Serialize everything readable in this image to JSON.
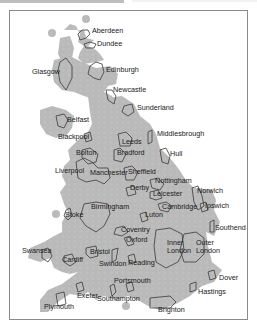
{
  "map": {
    "type": "hexagonal cartogram",
    "region": "United Kingdom",
    "colors": {
      "land_fill": "#bdbdbd",
      "hex_stroke": "#a8a8a8",
      "city_outline": "#3a3a3a",
      "frame": "#8a8a8a",
      "background": "#ffffff",
      "label": "#1a1a1a"
    },
    "labels": [
      {
        "name": "Aberdeen",
        "x": 92,
        "y": 33
      },
      {
        "name": "Dundee",
        "x": 97,
        "y": 46
      },
      {
        "name": "Glasgow",
        "x": 32,
        "y": 74
      },
      {
        "name": "Edinburgh",
        "x": 106,
        "y": 72
      },
      {
        "name": "Newcastle",
        "x": 113,
        "y": 92
      },
      {
        "name": "Sunderland",
        "x": 137,
        "y": 110
      },
      {
        "name": "Belfast",
        "x": 67,
        "y": 122
      },
      {
        "name": "Blackpool",
        "x": 58,
        "y": 139
      },
      {
        "name": "Middlesbrough",
        "x": 157,
        "y": 136
      },
      {
        "name": "Bolton",
        "x": 76,
        "y": 155
      },
      {
        "name": "Leeds",
        "x": 122,
        "y": 144
      },
      {
        "name": "Bradford",
        "x": 117,
        "y": 155
      },
      {
        "name": "Hull",
        "x": 170,
        "y": 156
      },
      {
        "name": "Liverpool",
        "x": 55,
        "y": 173
      },
      {
        "name": "Manchester",
        "x": 90,
        "y": 175
      },
      {
        "name": "Sheffield",
        "x": 128,
        "y": 174
      },
      {
        "name": "Nottingham",
        "x": 155,
        "y": 183
      },
      {
        "name": "Derby",
        "x": 130,
        "y": 190
      },
      {
        "name": "Norwich",
        "x": 197,
        "y": 193
      },
      {
        "name": "Leicester",
        "x": 153,
        "y": 196
      },
      {
        "name": "Ipswich",
        "x": 205,
        "y": 208
      },
      {
        "name": "Cambridge",
        "x": 162,
        "y": 209
      },
      {
        "name": "Birmingham",
        "x": 91,
        "y": 209
      },
      {
        "name": "Stoke",
        "x": 65,
        "y": 217
      },
      {
        "name": "Luton",
        "x": 145,
        "y": 217
      },
      {
        "name": "Southend",
        "x": 215,
        "y": 230
      },
      {
        "name": "Coventry",
        "x": 121,
        "y": 232
      },
      {
        "name": "Oxford",
        "x": 126,
        "y": 242
      },
      {
        "name": "Inner",
        "x": 167,
        "y": 245
      },
      {
        "name": "London",
        "x": 167,
        "y": 253
      },
      {
        "name": "Outer",
        "x": 196,
        "y": 245
      },
      {
        "name": "London",
        "x": 196,
        "y": 253
      },
      {
        "name": "Swansea",
        "x": 22,
        "y": 253
      },
      {
        "name": "Bristol",
        "x": 90,
        "y": 254
      },
      {
        "name": "Cardiff",
        "x": 62,
        "y": 262
      },
      {
        "name": "Swindon",
        "x": 99,
        "y": 266
      },
      {
        "name": "Reading",
        "x": 128,
        "y": 265
      },
      {
        "name": "Dover",
        "x": 219,
        "y": 280
      },
      {
        "name": "Portsmouth",
        "x": 114,
        "y": 283
      },
      {
        "name": "Hastings",
        "x": 198,
        "y": 294
      },
      {
        "name": "Exeter",
        "x": 77,
        "y": 298
      },
      {
        "name": "Southampton",
        "x": 97,
        "y": 301
      },
      {
        "name": "Plymouth",
        "x": 44,
        "y": 309
      },
      {
        "name": "Brighton",
        "x": 158,
        "y": 312
      }
    ]
  }
}
